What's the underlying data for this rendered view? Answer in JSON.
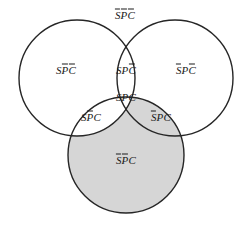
{
  "figure": {
    "name": "three-set-venn-diagram",
    "width": 250,
    "height": 225,
    "background_color": "#ffffff",
    "stroke_color": "#262626",
    "shade_color": "#d6d6d6",
    "label_color": "#1a1a1a"
  },
  "circles": [
    {
      "name": "set-s-circle",
      "label": "S",
      "cx": 77,
      "cy": 78,
      "r": 58,
      "filled": false
    },
    {
      "name": "set-p-circle",
      "label": "P",
      "cx": 175,
      "cy": 78,
      "r": 58,
      "filled": false
    },
    {
      "name": "set-c-circle",
      "label": "C",
      "cx": 126,
      "cy": 155,
      "r": 58,
      "filled": true
    }
  ],
  "regions": [
    {
      "name": "region-outside-all",
      "id": "not-s-not-p-not-c",
      "letters": [
        {
          "char": "S",
          "overline": true
        },
        {
          "char": "P",
          "overline": true
        },
        {
          "char": "C",
          "overline": true
        }
      ],
      "plain": "SPC",
      "x": 125,
      "y": 15,
      "shaded": false
    },
    {
      "name": "region-s-only",
      "id": "s-not-p-not-c",
      "letters": [
        {
          "char": "S",
          "overline": false
        },
        {
          "char": "P",
          "overline": true
        },
        {
          "char": "C",
          "overline": true
        }
      ],
      "plain": "SPC",
      "x": 66,
      "y": 70,
      "shaded": false
    },
    {
      "name": "region-s-and-p-only",
      "id": "s-p-not-c",
      "letters": [
        {
          "char": "S",
          "overline": false
        },
        {
          "char": "P",
          "overline": false
        },
        {
          "char": "C",
          "overline": true
        }
      ],
      "plain": "SPC",
      "x": 126,
      "y": 70,
      "shaded": false
    },
    {
      "name": "region-p-only",
      "id": "not-s-p-not-c",
      "letters": [
        {
          "char": "S",
          "overline": true
        },
        {
          "char": "P",
          "overline": false
        },
        {
          "char": "C",
          "overline": true
        }
      ],
      "plain": "SPC",
      "x": 186,
      "y": 70,
      "shaded": false
    },
    {
      "name": "region-all-three",
      "id": "s-p-c",
      "letters": [
        {
          "char": "S",
          "overline": false
        },
        {
          "char": "P",
          "overline": false
        },
        {
          "char": "C",
          "overline": false
        }
      ],
      "plain": "SPC",
      "x": 126,
      "y": 97,
      "shaded": false
    },
    {
      "name": "region-s-and-c-only",
      "id": "s-not-p-c",
      "letters": [
        {
          "char": "S",
          "overline": false
        },
        {
          "char": "P",
          "overline": true
        },
        {
          "char": "C",
          "overline": false
        }
      ],
      "plain": "SPC",
      "x": 91,
      "y": 117,
      "shaded": false
    },
    {
      "name": "region-p-and-c-only",
      "id": "not-s-p-c",
      "letters": [
        {
          "char": "S",
          "overline": true
        },
        {
          "char": "P",
          "overline": false
        },
        {
          "char": "C",
          "overline": false
        }
      ],
      "plain": "SPC",
      "x": 161,
      "y": 117,
      "shaded": true
    },
    {
      "name": "region-c-only",
      "id": "not-s-not-p-c",
      "letters": [
        {
          "char": "S",
          "overline": true
        },
        {
          "char": "P",
          "overline": true
        },
        {
          "char": "C",
          "overline": false
        }
      ],
      "plain": "SPC",
      "x": 126,
      "y": 160,
      "shaded": true
    }
  ]
}
